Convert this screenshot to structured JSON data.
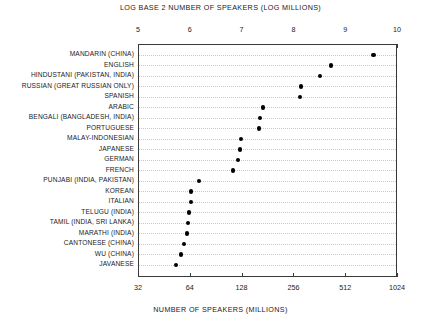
{
  "chart_data": {
    "type": "scatter",
    "title": "LOG BASE 2 NUMBER OF SPEAKERS (LOG MILLIONS)",
    "subtitle": "",
    "xlabel_top": "LOG BASE 2 NUMBER OF SPEAKERS (LOG MILLIONS)",
    "xlabel_bottom": "NUMBER OF SPEAKERS  (MILLIONS)",
    "ylabel": "",
    "orientation": "horizontal",
    "grid": "dotted-horizontal",
    "legend": "none",
    "xlim_top": [
      5,
      10
    ],
    "xlim_bottom": [
      32,
      1024
    ],
    "xticks_top": [
      "5",
      "6",
      "7",
      "8",
      "9",
      "10"
    ],
    "xticks_top_values": [
      5,
      6,
      7,
      8,
      9,
      10
    ],
    "xticks_bottom": [
      "32",
      "64",
      "128",
      "256",
      "512",
      "1024"
    ],
    "xticks_bottom_values": [
      32,
      64,
      128,
      256,
      512,
      1024
    ],
    "categories": [
      "MANDARIN (CHINA)",
      "ENGLISH",
      "HINDUSTANI (PAKISTAN, INDIA)",
      "RUSSIAN (GREAT RUSSIAN ONLY)",
      "SPANISH",
      "ARABIC",
      "BENGALI (BANGLADESH, INDIA)",
      "PORTUGUESE",
      "MALAY-INDONESIAN",
      "JAPANESE",
      "GERMAN",
      "FRENCH",
      "PUNJABI (INDIA, PAKISTAN)",
      "KOREAN",
      "ITALIAN",
      "TELUGU (INDIA)",
      "TAMIL (INDIA, SRI LANKA)",
      "MARATHI (INDIA)",
      "CANTONESE (CHINA)",
      "WU (CHINA)",
      "JAVANESE"
    ],
    "values": [
      9.53,
      8.71,
      8.49,
      8.13,
      8.11,
      7.39,
      7.33,
      7.32,
      6.97,
      6.95,
      6.91,
      6.81,
      6.16,
      6.0,
      6.0,
      5.96,
      5.95,
      5.93,
      5.87,
      5.81,
      5.71
    ],
    "values_millions": [
      740,
      420,
      360,
      280,
      276,
      168,
      161,
      160,
      125,
      124,
      120,
      112,
      72,
      64,
      64,
      62,
      62,
      61,
      58,
      56,
      52
    ],
    "units_top": "log2(millions)",
    "units_bottom": "millions of speakers"
  },
  "top_axis": {
    "title": "LOG BASE 2 NUMBER OF SPEAKERS (LOG MILLIONS)"
  },
  "bottom_axis": {
    "title": "NUMBER OF SPEAKERS  (MILLIONS)"
  }
}
